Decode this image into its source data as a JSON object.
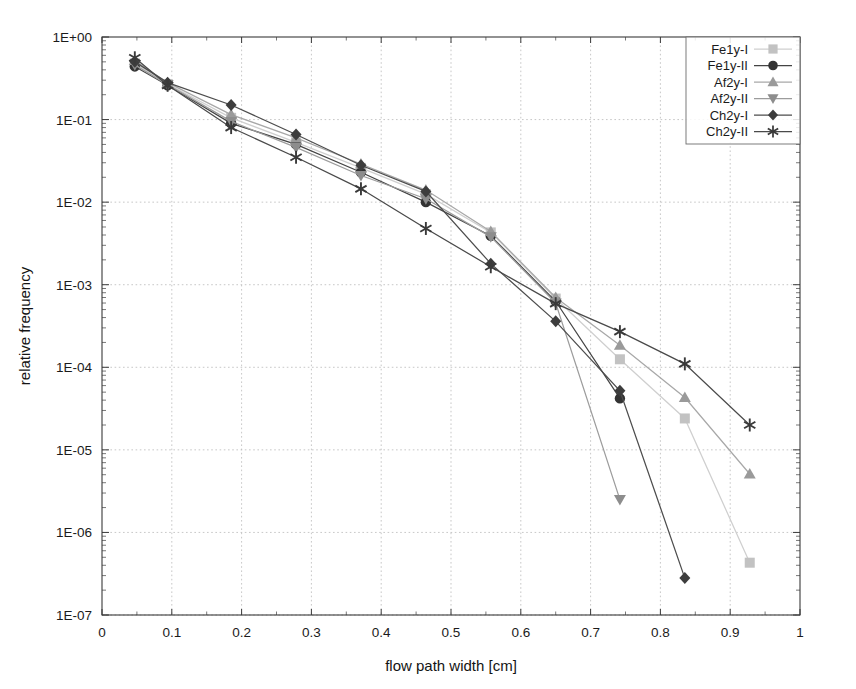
{
  "chart_data": {
    "type": "line",
    "title": "",
    "xlabel": "flow path width [cm]",
    "ylabel": "relative frequency",
    "xlim": [
      0,
      1
    ],
    "ylim": [
      1e-07,
      1
    ],
    "yscale": "log",
    "xscale": "linear",
    "grid": true,
    "legend_position": "top-right",
    "x_ticks": [
      "0",
      "0.1",
      "0.2",
      "0.3",
      "0.4",
      "0.5",
      "0.6",
      "0.7",
      "0.8",
      "0.9",
      "1"
    ],
    "x_tick_values": [
      0,
      0.1,
      0.2,
      0.3,
      0.4,
      0.5,
      0.6,
      0.7,
      0.8,
      0.9,
      1
    ],
    "y_ticks": [
      "1E+00",
      "1E-01",
      "1E-02",
      "1E-03",
      "1E-04",
      "1E-05",
      "1E-06",
      "1E-07"
    ],
    "y_tick_values": [
      1,
      0.1,
      0.01,
      0.001,
      0.0001,
      1e-05,
      1e-06,
      1e-07
    ],
    "series": [
      {
        "name": "Fe1y-I",
        "marker": "square",
        "color": "#c2c2c2",
        "line_color": "#cfcfcf",
        "x": [
          0.047,
          0.094,
          0.185,
          0.278,
          0.371,
          0.464,
          0.557,
          0.65,
          0.742,
          0.835,
          0.928
        ],
        "y": [
          0.48,
          0.27,
          0.105,
          0.053,
          0.026,
          0.0125,
          0.0043,
          0.00068,
          0.000125,
          2.4e-05,
          4.3e-07
        ]
      },
      {
        "name": "Fe1y-II",
        "marker": "circle",
        "color": "#333333",
        "line_color": "#444444",
        "x": [
          0.047,
          0.094,
          0.185,
          0.278,
          0.371,
          0.464,
          0.557,
          0.65,
          0.742
        ],
        "y": [
          0.44,
          0.26,
          0.09,
          0.05,
          0.023,
          0.01,
          0.0039,
          0.00063,
          4.2e-05
        ]
      },
      {
        "name": "Af2y-I",
        "marker": "triangle-up",
        "color": "#9a9a9a",
        "line_color": "#a8a8a8",
        "x": [
          0.047,
          0.094,
          0.185,
          0.278,
          0.371,
          0.464,
          0.557,
          0.65,
          0.742,
          0.835,
          0.928
        ],
        "y": [
          0.52,
          0.28,
          0.115,
          0.06,
          0.029,
          0.014,
          0.0044,
          0.0007,
          0.000185,
          4.3e-05,
          5.1e-06
        ]
      },
      {
        "name": "Af2y-II",
        "marker": "triangle-down",
        "color": "#8d8d8d",
        "line_color": "#9c9c9c",
        "x": [
          0.047,
          0.094,
          0.185,
          0.278,
          0.371,
          0.464,
          0.557,
          0.65,
          0.742
        ],
        "y": [
          0.46,
          0.265,
          0.095,
          0.046,
          0.021,
          0.011,
          0.0038,
          0.0006,
          2.5e-06
        ]
      },
      {
        "name": "Ch2y-I",
        "marker": "diamond",
        "color": "#3d3d3d",
        "line_color": "#4d4d4d",
        "x": [
          0.047,
          0.094,
          0.185,
          0.278,
          0.371,
          0.464,
          0.557,
          0.65,
          0.742,
          0.835
        ],
        "y": [
          0.5,
          0.28,
          0.15,
          0.066,
          0.028,
          0.0135,
          0.0018,
          0.00036,
          5.2e-05,
          2.8e-07
        ]
      },
      {
        "name": "Ch2y-II",
        "marker": "asterisk",
        "color": "#3a3a3a",
        "line_color": "#4a4a4a",
        "x": [
          0.047,
          0.094,
          0.185,
          0.278,
          0.371,
          0.464,
          0.557,
          0.65,
          0.742,
          0.835,
          0.928
        ],
        "y": [
          0.56,
          0.26,
          0.08,
          0.035,
          0.0145,
          0.0048,
          0.00165,
          0.00059,
          0.00027,
          0.00011,
          2e-05
        ]
      }
    ]
  },
  "legend": {
    "entries": [
      {
        "label": "Fe1y-I"
      },
      {
        "label": "Fe1y-II"
      },
      {
        "label": "Af2y-I"
      },
      {
        "label": "Af2y-II"
      },
      {
        "label": "Ch2y-I"
      },
      {
        "label": "Ch2y-II"
      }
    ]
  }
}
